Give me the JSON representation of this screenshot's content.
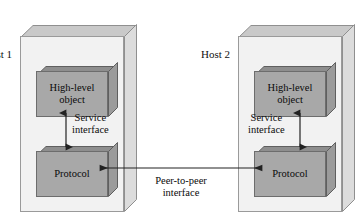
{
  "diagram": {
    "background_color": "#ffffff",
    "host_face_color": "#f2f2f2",
    "module_face_color": "#a8a8a8",
    "line_color": "#333333"
  },
  "hosts": [
    {
      "id": "host-1",
      "label": "Host 1",
      "modules": [
        {
          "id": "high-level-object",
          "line1": "High-level",
          "line2": "object"
        },
        {
          "id": "protocol",
          "line1": "Protocol",
          "line2": ""
        }
      ],
      "service_interface": {
        "line1": "Service",
        "line2": "interface"
      }
    },
    {
      "id": "host-2",
      "label": "Host 2",
      "modules": [
        {
          "id": "high-level-object",
          "line1": "High-level",
          "line2": "object"
        },
        {
          "id": "protocol",
          "line1": "Protocol",
          "line2": ""
        }
      ],
      "service_interface": {
        "line1": "Service",
        "line2": "interface"
      }
    }
  ],
  "peer_interface": {
    "line1": "Peer-to-peer",
    "line2": "interface"
  }
}
